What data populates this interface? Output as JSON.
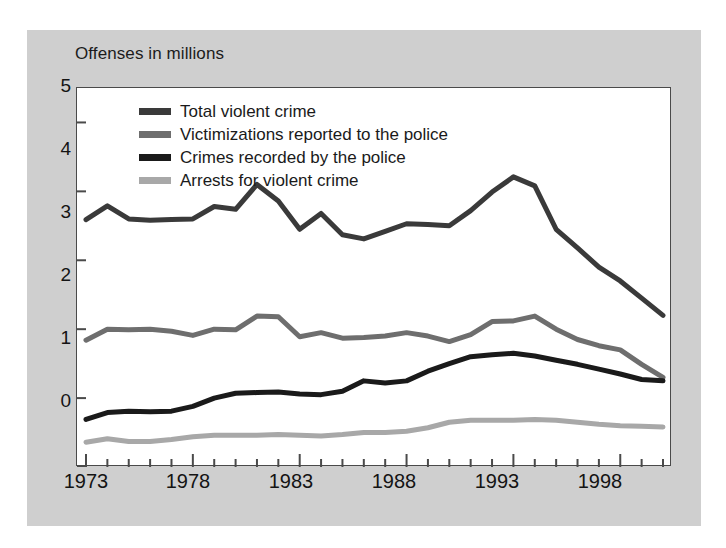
{
  "chart_title": "Offenses in millions",
  "colors": {
    "panel_background": "#cfcfcf",
    "plot_background": "#ffffff",
    "frame": "#4a4a4a",
    "total_violent_crime": "#3a3a3a",
    "victimizations_reported": "#6e6e6e",
    "crimes_recorded": "#1a1a1a",
    "arrests": "#a8a8a8"
  },
  "legend": {
    "position": "top-left-inside-plot",
    "entries": [
      {
        "label": "Total violent crime",
        "color": "#3a3a3a"
      },
      {
        "label": "Victimizations reported to the police",
        "color": "#6e6e6e"
      },
      {
        "label": "Crimes recorded by the police",
        "color": "#1a1a1a"
      },
      {
        "label": "Arrests for violent crime",
        "color": "#a8a8a8"
      }
    ]
  },
  "axis": {
    "y_ticks": [
      "0",
      "1",
      "2",
      "3",
      "4",
      "5"
    ],
    "x_ticks_labeled": [
      "1973",
      "1978",
      "1983",
      "1988",
      "1993",
      "1998"
    ]
  },
  "chart_data": {
    "type": "line",
    "title": "Offenses in millions",
    "xlabel": "",
    "ylabel": "Offenses in millions",
    "ylim": [
      0,
      5.5
    ],
    "xlim": [
      1973,
      2000
    ],
    "grid": false,
    "legend_position": "upper left",
    "x": [
      1973,
      1974,
      1975,
      1976,
      1977,
      1978,
      1979,
      1980,
      1981,
      1982,
      1983,
      1984,
      1985,
      1986,
      1987,
      1988,
      1989,
      1990,
      1991,
      1992,
      1993,
      1994,
      1995,
      1996,
      1997,
      1998,
      1999,
      2000
    ],
    "series": [
      {
        "name": "Total violent crime",
        "color": "#3a3a3a",
        "values": [
          3.59,
          3.79,
          3.6,
          3.58,
          3.59,
          3.6,
          3.78,
          3.74,
          4.1,
          3.86,
          3.45,
          3.68,
          3.37,
          3.31,
          3.42,
          3.53,
          3.52,
          3.5,
          3.72,
          3.99,
          4.21,
          4.08,
          3.45,
          3.18,
          2.9,
          2.7,
          2.45,
          2.2
        ]
      },
      {
        "name": "Victimizations reported to the police",
        "color": "#6e6e6e",
        "values": [
          1.84,
          2.0,
          1.99,
          2.0,
          1.97,
          1.91,
          2.0,
          1.99,
          2.19,
          2.18,
          1.89,
          1.95,
          1.87,
          1.88,
          1.9,
          1.95,
          1.9,
          1.82,
          1.92,
          2.11,
          2.12,
          2.19,
          2.0,
          1.85,
          1.76,
          1.7,
          1.49,
          1.3
        ]
      },
      {
        "name": "Crimes recorded by the police",
        "color": "#1a1a1a",
        "values": [
          0.69,
          0.79,
          0.81,
          0.8,
          0.81,
          0.88,
          1.0,
          1.07,
          1.08,
          1.09,
          1.06,
          1.05,
          1.1,
          1.25,
          1.22,
          1.25,
          1.39,
          1.5,
          1.6,
          1.63,
          1.65,
          1.61,
          1.55,
          1.49,
          1.42,
          1.35,
          1.27,
          1.25
        ]
      },
      {
        "name": "Arrests for violent crime",
        "color": "#a8a8a8",
        "values": [
          0.36,
          0.41,
          0.37,
          0.37,
          0.4,
          0.44,
          0.46,
          0.46,
          0.46,
          0.47,
          0.46,
          0.45,
          0.47,
          0.5,
          0.5,
          0.52,
          0.57,
          0.65,
          0.68,
          0.68,
          0.68,
          0.69,
          0.68,
          0.65,
          0.62,
          0.6,
          0.59,
          0.58
        ]
      }
    ]
  }
}
